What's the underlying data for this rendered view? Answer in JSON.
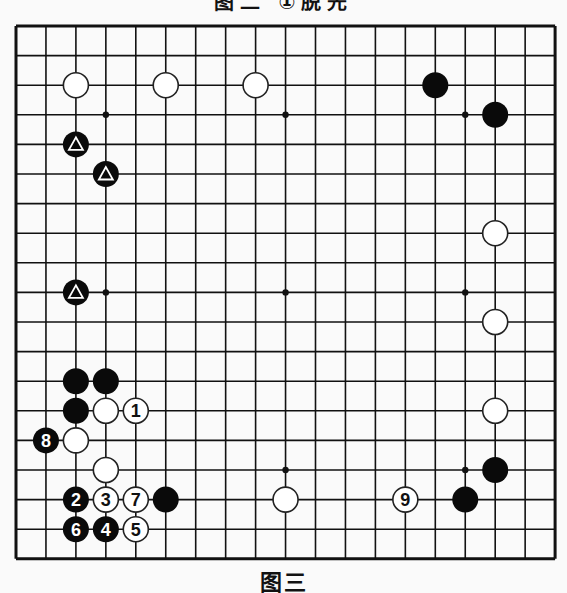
{
  "top_caption": "图二 ①脱先",
  "bottom_caption": "图三",
  "board": {
    "size": 19,
    "origin_x": 16,
    "origin_y": 26,
    "spacing_x": 29.95,
    "spacing_y": 29.6,
    "line_color": "#111111",
    "hoshi": [
      [
        3,
        3
      ],
      [
        9,
        3
      ],
      [
        15,
        3
      ],
      [
        3,
        9
      ],
      [
        9,
        9
      ],
      [
        15,
        9
      ],
      [
        3,
        15
      ],
      [
        9,
        15
      ],
      [
        15,
        15
      ]
    ],
    "stones": [
      {
        "col": 2,
        "row": 2,
        "color": "white",
        "label": ""
      },
      {
        "col": 5,
        "row": 2,
        "color": "white",
        "label": ""
      },
      {
        "col": 8,
        "row": 2,
        "color": "white",
        "label": ""
      },
      {
        "col": 14,
        "row": 2,
        "color": "black",
        "label": ""
      },
      {
        "col": 16,
        "row": 3,
        "color": "black",
        "label": ""
      },
      {
        "col": 2,
        "row": 4,
        "color": "black",
        "label": "△"
      },
      {
        "col": 3,
        "row": 5,
        "color": "black",
        "label": "△"
      },
      {
        "col": 16,
        "row": 7,
        "color": "white",
        "label": ""
      },
      {
        "col": 2,
        "row": 9,
        "color": "black",
        "label": "△"
      },
      {
        "col": 16,
        "row": 10,
        "color": "white",
        "label": ""
      },
      {
        "col": 2,
        "row": 12,
        "color": "black",
        "label": ""
      },
      {
        "col": 3,
        "row": 12,
        "color": "black",
        "label": ""
      },
      {
        "col": 2,
        "row": 13,
        "color": "black",
        "label": ""
      },
      {
        "col": 3,
        "row": 13,
        "color": "white",
        "label": ""
      },
      {
        "col": 4,
        "row": 13,
        "color": "white",
        "label": "1"
      },
      {
        "col": 16,
        "row": 13,
        "color": "white",
        "label": ""
      },
      {
        "col": 1,
        "row": 14,
        "color": "black",
        "label": "8"
      },
      {
        "col": 2,
        "row": 14,
        "color": "white",
        "label": ""
      },
      {
        "col": 3,
        "row": 15,
        "color": "white",
        "label": ""
      },
      {
        "col": 16,
        "row": 15,
        "color": "black",
        "label": ""
      },
      {
        "col": 2,
        "row": 16,
        "color": "black",
        "label": "2"
      },
      {
        "col": 3,
        "row": 16,
        "color": "white",
        "label": "3"
      },
      {
        "col": 4,
        "row": 16,
        "color": "white",
        "label": "7"
      },
      {
        "col": 5,
        "row": 16,
        "color": "black",
        "label": ""
      },
      {
        "col": 9,
        "row": 16,
        "color": "white",
        "label": ""
      },
      {
        "col": 13,
        "row": 16,
        "color": "white",
        "label": "9"
      },
      {
        "col": 15,
        "row": 16,
        "color": "black",
        "label": ""
      },
      {
        "col": 2,
        "row": 17,
        "color": "black",
        "label": "6"
      },
      {
        "col": 3,
        "row": 17,
        "color": "black",
        "label": "4"
      },
      {
        "col": 4,
        "row": 17,
        "color": "white",
        "label": "5"
      }
    ]
  }
}
